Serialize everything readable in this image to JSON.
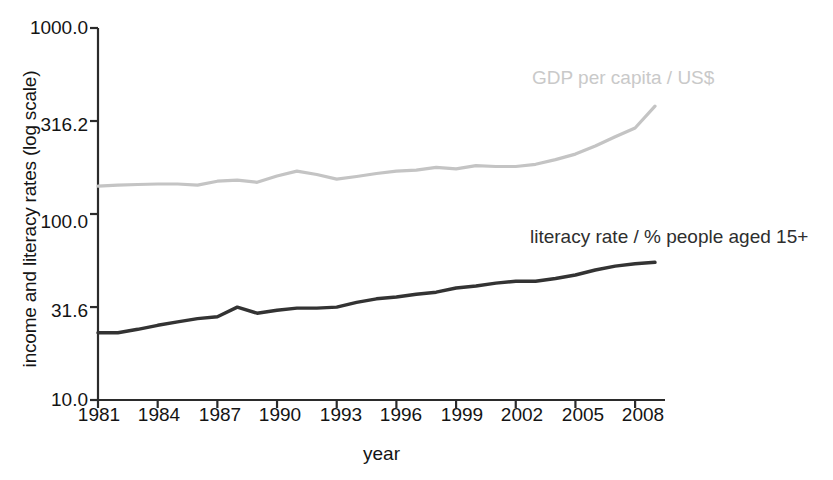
{
  "chart_data": {
    "type": "line",
    "title": "",
    "xlabel": "year",
    "ylabel": "income and literacy rates (log scale)",
    "log_scale": true,
    "grid": false,
    "legend_position": "inline-annotation",
    "xlim": [
      1981,
      2009
    ],
    "ylim": [
      10.0,
      1000.0
    ],
    "x_tick_labels": [
      "1981",
      "1984",
      "1987",
      "1990",
      "1993",
      "1996",
      "1999",
      "2002",
      "2005",
      "2008"
    ],
    "x_ticks": [
      1981,
      1984,
      1987,
      1990,
      1993,
      1996,
      1999,
      2002,
      2005,
      2008
    ],
    "y_tick_labels": [
      "1000.0",
      "316.2",
      "100.0",
      "31.6",
      "10.0"
    ],
    "y_ticks": [
      1000.0,
      316.2,
      100.0,
      31.6,
      10.0
    ],
    "x": [
      1981,
      1982,
      1983,
      1984,
      1985,
      1986,
      1987,
      1988,
      1989,
      1990,
      1991,
      1992,
      1993,
      1994,
      1995,
      1996,
      1997,
      1998,
      1999,
      2000,
      2001,
      2002,
      2003,
      2004,
      2005,
      2006,
      2007,
      2008,
      2009
    ],
    "series": [
      {
        "name": "GDP per capita / US$",
        "color": "#c4c4c4",
        "label": "GDP per capita / US$",
        "values": [
          141,
          143,
          144,
          145,
          145,
          143,
          150,
          152,
          148,
          160,
          170,
          163,
          154,
          159,
          165,
          170,
          172,
          178,
          175,
          182,
          180,
          180,
          185,
          196,
          210,
          232,
          260,
          290,
          380
        ]
      },
      {
        "name": "literacy rate / % people aged 15+",
        "color": "#333333",
        "label": "literacy rate / % people aged 15+",
        "values": [
          23.0,
          23.0,
          24.0,
          25.2,
          26.3,
          27.4,
          28.0,
          31.6,
          29.3,
          30.4,
          31.2,
          31.2,
          31.6,
          33.5,
          35.0,
          35.8,
          37.0,
          38.0,
          40.0,
          41.0,
          42.5,
          43.5,
          43.5,
          45.0,
          47.0,
          50.0,
          52.5,
          54.0,
          55.0
        ]
      }
    ],
    "annotations": [
      {
        "text": "GDP per capita / US$",
        "color": "#c4c4c4"
      },
      {
        "text": "literacy rate / % people aged 15+",
        "color": "#2e2e2e"
      }
    ]
  },
  "axis": {
    "y_title": "income and literacy rates (log scale)",
    "x_title": "year"
  }
}
